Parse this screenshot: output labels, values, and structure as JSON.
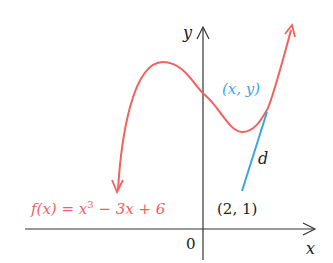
{
  "figure": {
    "function_label": "f(x) = x³ − 3x + 6",
    "function_label_parts": {
      "pre": "f(x) = x",
      "sup": "3",
      "post": " − 3x + 6"
    },
    "point_on_curve_label": "(x, y)",
    "fixed_point_label": "(2, 1)",
    "distance_label": "d",
    "origin_label": "0",
    "x_axis_label": "x",
    "y_axis_label": "y",
    "colors": {
      "curve": "#f0625f",
      "distance_segment": "#3aa6df",
      "axes": "#333333",
      "text": "#222222"
    }
  }
}
